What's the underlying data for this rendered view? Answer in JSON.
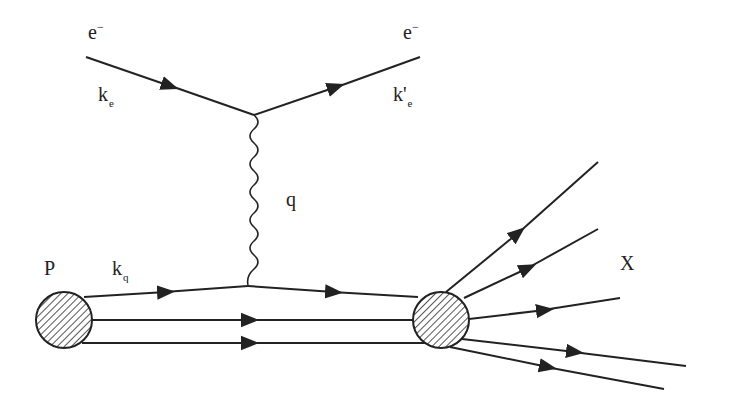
{
  "diagram": {
    "type": "feynman",
    "labels": {
      "incoming_electron": "e",
      "incoming_electron_charge": "−",
      "incoming_momentum": "k",
      "incoming_momentum_sub": "e",
      "outgoing_electron": "e",
      "outgoing_electron_charge": "−",
      "outgoing_momentum": "k'",
      "outgoing_momentum_sub": "e",
      "photon_momentum": "q",
      "proton": "P",
      "quark_momentum": "k",
      "quark_momentum_sub": "q",
      "final_state": "X"
    },
    "colors": {
      "line": "#222222",
      "hatch": "#555555",
      "background": "#ffffff"
    },
    "outgoing_hadron_lines": 5
  }
}
